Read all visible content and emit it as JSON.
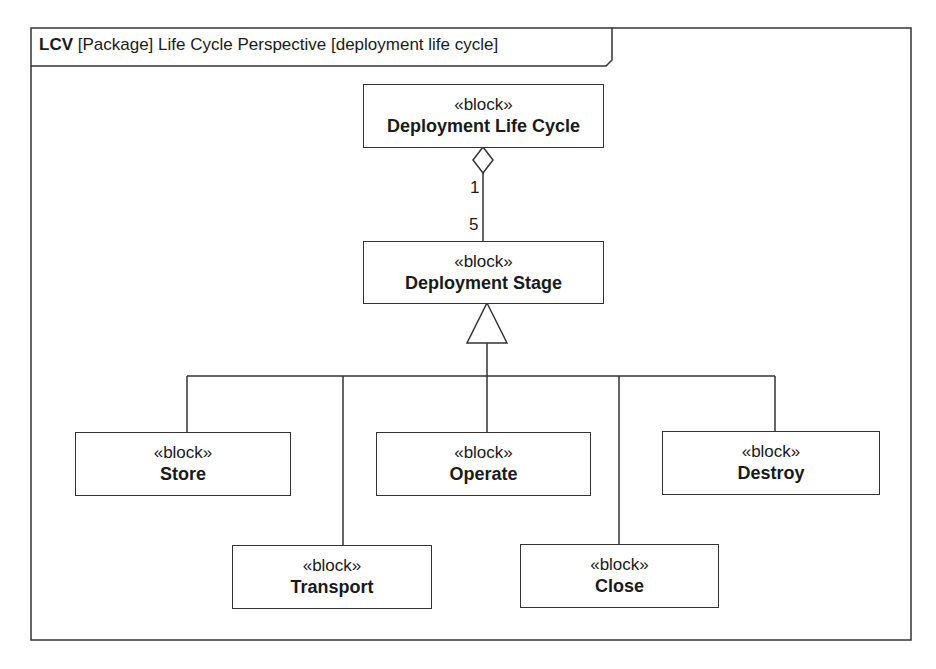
{
  "frame": {
    "kind": "LCV",
    "title_rest": "[Package] Life Cycle Perspective [deployment life cycle]"
  },
  "blocks": {
    "lifecycle": {
      "stereotype": "«block»",
      "name": "Deployment Life Cycle"
    },
    "stage": {
      "stereotype": "«block»",
      "name": "Deployment Stage"
    },
    "store": {
      "stereotype": "«block»",
      "name": "Store"
    },
    "transport": {
      "stereotype": "«block»",
      "name": "Transport"
    },
    "operate": {
      "stereotype": "«block»",
      "name": "Operate"
    },
    "close": {
      "stereotype": "«block»",
      "name": "Close"
    },
    "destroy": {
      "stereotype": "«block»",
      "name": "Destroy"
    }
  },
  "association": {
    "type": "aggregation",
    "whole_multiplicity": "1",
    "part_multiplicity": "5"
  },
  "generalization": {
    "parent": "Deployment Stage",
    "children": [
      "Store",
      "Transport",
      "Operate",
      "Close",
      "Destroy"
    ]
  },
  "colors": {
    "line": "#333333",
    "background": "#ffffff",
    "text": "#1a1a1a"
  }
}
